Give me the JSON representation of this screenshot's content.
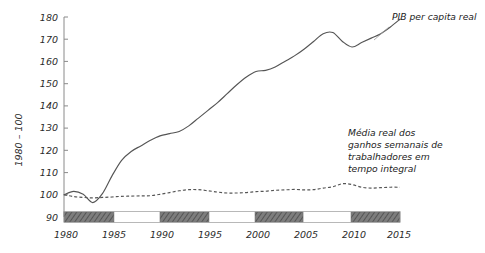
{
  "chart_data": {
    "type": "line",
    "title": "",
    "xlabel": "",
    "ylabel": "1980 – 100",
    "xlim": [
      1980,
      2015
    ],
    "ylim": [
      90,
      180
    ],
    "grid": false,
    "legend_position": "inline-annotation",
    "y_ticks": [
      90,
      100,
      110,
      120,
      130,
      140,
      150,
      160,
      170,
      180
    ],
    "x_ticks": [
      1980,
      1985,
      1990,
      1995,
      2000,
      2005,
      2010,
      2015
    ],
    "x_tick_labels": [
      "1980",
      "1985",
      "1990",
      "1995",
      "2000",
      "2005",
      "2010",
      "2015"
    ],
    "y_tick_labels": [
      "90",
      "100",
      "110",
      "120",
      "130",
      "140",
      "150",
      "160",
      "170",
      "180"
    ],
    "x": [
      1980,
      1981,
      1982,
      1983,
      1984,
      1985,
      1986,
      1987,
      1988,
      1989,
      1990,
      1991,
      1992,
      1993,
      1994,
      1995,
      1996,
      1997,
      1998,
      1999,
      2000,
      2001,
      2002,
      2003,
      2004,
      2005,
      2006,
      2007,
      2008,
      2009,
      2010,
      2011,
      2012,
      2013,
      2014,
      2015
    ],
    "series": [
      {
        "name": "PIB per capita real",
        "style": "solid",
        "label": "PIB per capita real",
        "values": [
          100,
          101.5,
          100.2,
          96.5,
          100.5,
          108.5,
          115.5,
          119.5,
          122.0,
          124.5,
          126.5,
          127.5,
          128.5,
          131.0,
          134.5,
          138.0,
          141.5,
          145.5,
          149.5,
          153.0,
          155.5,
          156.0,
          157.5,
          160.0,
          162.5,
          165.5,
          169.0,
          172.5,
          173.0,
          169.0,
          166.5,
          168.5,
          170.5,
          172.5,
          175.5,
          179.0
        ]
      },
      {
        "name": "Média real dos ganhos semanais de trabalhadores em tempo integral",
        "style": "dashed",
        "label": "Média real dos ganhos semanais de trabalhadores em tempo integral",
        "values": [
          100,
          99.2,
          98.8,
          98.6,
          98.8,
          99.0,
          99.3,
          99.4,
          99.5,
          99.6,
          100.2,
          101.0,
          101.8,
          102.3,
          102.3,
          101.8,
          101.2,
          100.8,
          100.8,
          101.0,
          101.4,
          101.6,
          102.0,
          102.2,
          102.4,
          102.2,
          102.3,
          103.0,
          103.6,
          105.0,
          104.6,
          103.4,
          103.0,
          103.2,
          103.4,
          103.4
        ]
      }
    ],
    "annotations": [
      {
        "name": "gdp-annotation",
        "text": "PIB per capita real",
        "lines": [
          "PIB per capita real"
        ]
      },
      {
        "name": "earnings-annotation",
        "text": "Média real dos ganhos semanais de trabalhadores em tempo integral",
        "lines": [
          "Média real dos",
          "ganhos semanais de",
          "trabalhadores em",
          "tempo integral"
        ]
      }
    ],
    "recession_bands": [
      {
        "start": 1980.0,
        "end": 1985.2
      },
      {
        "start": 1990.0,
        "end": 1995.1
      },
      {
        "start": 1999.9,
        "end": 2004.9
      },
      {
        "start": 2009.9,
        "end": 2015.0
      }
    ],
    "colors": {
      "line": "#555555",
      "axis": "#8a8a8a",
      "text": "#2b2b2b",
      "band_fill": "#7d7d7d",
      "background": "#ffffff"
    }
  }
}
